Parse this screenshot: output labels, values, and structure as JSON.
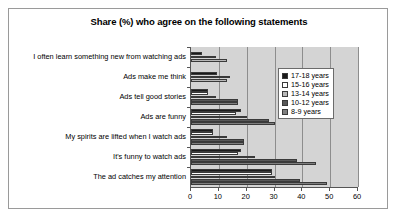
{
  "chart_data": {
    "type": "bar",
    "orientation": "horizontal",
    "title": "Share (%) who agree on the following statements",
    "xlabel": "",
    "ylabel": "",
    "xlim": [
      0,
      60
    ],
    "xticks": [
      0,
      10,
      20,
      30,
      40,
      50,
      60
    ],
    "grid": true,
    "grid_axis": "x",
    "legend_position": "upper right",
    "categories": [
      "I often learn something new from watching ads",
      "Ads make me think",
      "Ads tell good stories",
      "Ads are funny",
      "My spirits are lifted when I watch ads",
      "It's funny to watch ads",
      "The ad catches my attention"
    ],
    "series": [
      {
        "name": "17-18 years",
        "color": "#1a1a1a",
        "values": [
          4,
          9.5,
          6,
          18,
          8,
          18,
          29
        ]
      },
      {
        "name": "15-16 years",
        "color": "#ffffff",
        "values": [
          9,
          14,
          6,
          16,
          8,
          17,
          29
        ]
      },
      {
        "name": "13-14 years",
        "color": "#b8b8b8",
        "values": [
          13,
          13,
          9,
          20,
          13,
          23,
          30
        ]
      },
      {
        "name": "10-12 years",
        "color": "#585858",
        "values": [
          0,
          0,
          17,
          28,
          19,
          38,
          39
        ]
      },
      {
        "name": "8-9 years",
        "color": "#7e7e7e",
        "values": [
          0,
          0,
          17,
          30,
          19,
          45,
          49
        ]
      }
    ]
  }
}
